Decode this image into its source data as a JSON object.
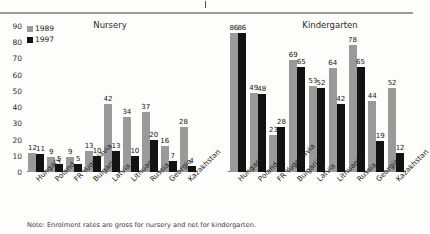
{
  "legend": {
    "items": [
      {
        "label": "1989",
        "color": "#9a9a9a"
      },
      {
        "label": "1997",
        "color": "#121212"
      }
    ]
  },
  "note": "Note: Enrolment rates are gross for nursery and net for kindergarten.",
  "axis": {
    "ticks": [
      "0",
      "10",
      "20",
      "30",
      "40",
      "50",
      "60",
      "70",
      "80",
      "90"
    ]
  },
  "chart_data": [
    {
      "type": "bar",
      "title": "Nursery",
      "xlabel": "",
      "ylabel": "",
      "ylim": [
        0,
        90
      ],
      "grid": false,
      "legend_position": "top-left",
      "categories": [
        "Hungary",
        "Poland",
        "FR Yugoslavia",
        "Bulgaria",
        "Latvia",
        "Lithuania",
        "Russia",
        "Georgia",
        "Kazakhstan"
      ],
      "series": [
        {
          "name": "1989",
          "values": [
            12,
            9,
            9,
            13,
            42,
            34,
            37,
            16,
            28
          ]
        },
        {
          "name": "1997",
          "values": [
            11,
            5,
            5,
            10,
            13,
            10,
            20,
            7,
            4
          ]
        }
      ]
    },
    {
      "type": "bar",
      "title": "Kindergarten",
      "xlabel": "",
      "ylabel": "",
      "ylim": [
        0,
        90
      ],
      "grid": false,
      "legend_position": "none",
      "categories": [
        "Hungary",
        "Poland",
        "FR Yugoslavia",
        "Bulgaria",
        "Latvia",
        "Lithuania",
        "Russia",
        "Georgia",
        "Kazakhstan"
      ],
      "series": [
        {
          "name": "1989",
          "values": [
            86,
            49,
            23,
            69,
            53,
            64,
            78,
            44,
            52
          ]
        },
        {
          "name": "1997",
          "values": [
            86,
            48,
            28,
            65,
            52,
            42,
            65,
            19,
            12
          ]
        }
      ]
    }
  ]
}
